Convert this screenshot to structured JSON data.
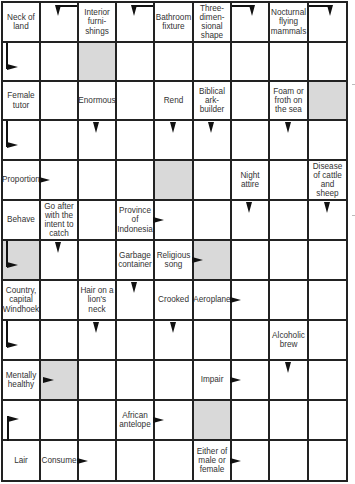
{
  "puzzle": {
    "type": "arrowword",
    "columns": 9,
    "rows": 12,
    "colors": {
      "grid_line": "#222222",
      "shaded": "#d9d9d9",
      "arrow": "#111111",
      "text": "#333333"
    }
  },
  "cells": [
    {
      "r": 0,
      "c": 0,
      "clue": "Neck of land"
    },
    {
      "r": 0,
      "c": 1,
      "arrow": "elbow-down-right-top"
    },
    {
      "r": 0,
      "c": 2,
      "clue": "Interior furni-shings"
    },
    {
      "r": 0,
      "c": 3,
      "arrow": "elbow-down-right-top"
    },
    {
      "r": 0,
      "c": 4,
      "clue": "Bathroom fixture"
    },
    {
      "r": 0,
      "c": 5,
      "clue": "Three-dimen-sional shape"
    },
    {
      "r": 0,
      "c": 6,
      "arrow": "elbow-down-left-top"
    },
    {
      "r": 0,
      "c": 7,
      "clue": "Nocturnal flying mammals"
    },
    {
      "r": 0,
      "c": 8,
      "arrow": "elbow-down-left-top"
    },
    {
      "r": 1,
      "c": 0,
      "arrow": "elbow-right-left"
    },
    {
      "r": 1,
      "c": 2,
      "shaded": true
    },
    {
      "r": 2,
      "c": 0,
      "clue": "Female tutor"
    },
    {
      "r": 2,
      "c": 2,
      "clue": "Enormous"
    },
    {
      "r": 2,
      "c": 4,
      "clue": "Rend"
    },
    {
      "r": 2,
      "c": 5,
      "clue": "Biblical ark-builder"
    },
    {
      "r": 2,
      "c": 7,
      "clue": "Foam or froth on the sea"
    },
    {
      "r": 2,
      "c": 8,
      "shaded": true
    },
    {
      "r": 3,
      "c": 0,
      "arrow": "elbow-right-left"
    },
    {
      "r": 3,
      "c": 2,
      "arrow": "down"
    },
    {
      "r": 3,
      "c": 4,
      "arrow": "down"
    },
    {
      "r": 3,
      "c": 5,
      "arrow": "down"
    },
    {
      "r": 3,
      "c": 7,
      "arrow": "down"
    },
    {
      "r": 4,
      "c": 0,
      "clue": "Proportion",
      "arrow": "right"
    },
    {
      "r": 4,
      "c": 4,
      "shaded": true
    },
    {
      "r": 4,
      "c": 6,
      "clue": "Night attire"
    },
    {
      "r": 4,
      "c": 8,
      "clue": "Disease of cattle and sheep"
    },
    {
      "r": 5,
      "c": 0,
      "clue": "Behave"
    },
    {
      "r": 5,
      "c": 1,
      "clue": "Go after with the intent to catch"
    },
    {
      "r": 5,
      "c": 3,
      "clue": "Province of Indonesia",
      "arrow": "right"
    },
    {
      "r": 5,
      "c": 6,
      "arrow": "down"
    },
    {
      "r": 5,
      "c": 8,
      "arrow": "down"
    },
    {
      "r": 6,
      "c": 0,
      "shaded": true,
      "arrow": "elbow-right-left"
    },
    {
      "r": 6,
      "c": 1,
      "arrow": "down"
    },
    {
      "r": 6,
      "c": 3,
      "clue": "Garbage container"
    },
    {
      "r": 6,
      "c": 4,
      "clue": "Religious song",
      "arrow": "right"
    },
    {
      "r": 6,
      "c": 5,
      "shaded": true
    },
    {
      "r": 7,
      "c": 0,
      "clue": "Country, capital Windhoek"
    },
    {
      "r": 7,
      "c": 2,
      "clue": "Hair on a lion's neck"
    },
    {
      "r": 7,
      "c": 3,
      "arrow": "down"
    },
    {
      "r": 7,
      "c": 4,
      "clue": "Crooked"
    },
    {
      "r": 7,
      "c": 5,
      "clue": "Aeroplane",
      "arrow": "right"
    },
    {
      "r": 8,
      "c": 0,
      "arrow": "elbow-right-left"
    },
    {
      "r": 8,
      "c": 2,
      "arrow": "down"
    },
    {
      "r": 8,
      "c": 4,
      "arrow": "down"
    },
    {
      "r": 8,
      "c": 7,
      "clue": "Alcoholic brew"
    },
    {
      "r": 9,
      "c": 0,
      "clue": "Mentally healthy"
    },
    {
      "r": 9,
      "c": 1,
      "shaded": true,
      "arrow": "right-left"
    },
    {
      "r": 9,
      "c": 5,
      "clue": "Impair",
      "arrow": "right"
    },
    {
      "r": 9,
      "c": 7,
      "arrow": "down"
    },
    {
      "r": 10,
      "c": 0,
      "arrow": "elbow-right-up"
    },
    {
      "r": 10,
      "c": 3,
      "clue": "African antelope",
      "arrow": "right"
    },
    {
      "r": 10,
      "c": 5,
      "shaded": true
    },
    {
      "r": 11,
      "c": 0,
      "clue": "Lair"
    },
    {
      "r": 11,
      "c": 1,
      "clue": "Consume",
      "arrow": "right"
    },
    {
      "r": 11,
      "c": 5,
      "clue": "Either of male or female",
      "arrow": "right"
    }
  ]
}
